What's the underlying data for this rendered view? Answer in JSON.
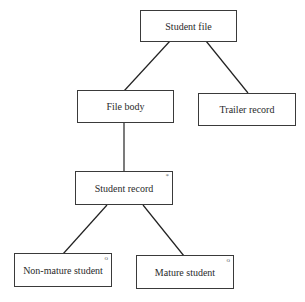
{
  "diagram": {
    "type": "JSP structure diagram",
    "nodes": [
      {
        "id": "student-file",
        "label": "Student file",
        "marker": ""
      },
      {
        "id": "file-body",
        "label": "File body",
        "marker": ""
      },
      {
        "id": "trailer-record",
        "label": "Trailer record",
        "marker": ""
      },
      {
        "id": "student-record",
        "label": "Student record",
        "marker": "*"
      },
      {
        "id": "non-mature-student",
        "label": "Non-mature student",
        "marker": "o"
      },
      {
        "id": "mature-student",
        "label": "Mature student",
        "marker": "o"
      }
    ],
    "edges": [
      [
        "student-file",
        "file-body"
      ],
      [
        "student-file",
        "trailer-record"
      ],
      [
        "file-body",
        "student-record"
      ],
      [
        "student-record",
        "non-mature-student"
      ],
      [
        "student-record",
        "mature-student"
      ]
    ]
  }
}
